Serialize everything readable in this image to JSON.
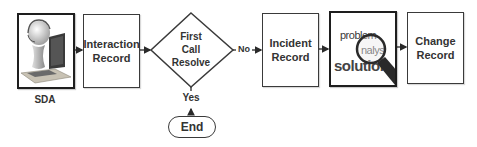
{
  "diagram": {
    "type": "flowchart",
    "nodes": {
      "sda": {
        "label": "SDA",
        "image": "service-desk-agent-at-computer"
      },
      "interaction_record": {
        "line1": "Interaction",
        "line2": "Record"
      },
      "first_call_resolve": {
        "line1": "First",
        "line2": "Call",
        "line3": "Resolve"
      },
      "end": {
        "label": "End"
      },
      "incident_record": {
        "line1": "Incident",
        "line2": "Record"
      },
      "analysis": {
        "image": "problem-analysis-solution-magnifier",
        "word_problem": "problem",
        "word_analysis": "nalys",
        "word_solution": "solution"
      },
      "change_record": {
        "line1": "Change",
        "line2": "Record"
      }
    },
    "edges": [
      {
        "from": "sda",
        "to": "interaction_record",
        "label": ""
      },
      {
        "from": "interaction_record",
        "to": "first_call_resolve",
        "label": ""
      },
      {
        "from": "first_call_resolve",
        "to": "incident_record",
        "label": "No"
      },
      {
        "from": "end",
        "to": "first_call_resolve",
        "label": "Yes"
      },
      {
        "from": "incident_record",
        "to": "analysis",
        "label": ""
      },
      {
        "from": "analysis",
        "to": "change_record",
        "label": ""
      }
    ],
    "edge_labels": {
      "no": "No",
      "yes": "Yes"
    },
    "colors": {
      "stroke": "#3a3a3a",
      "text": "#333333",
      "background": "#ffffff"
    }
  }
}
